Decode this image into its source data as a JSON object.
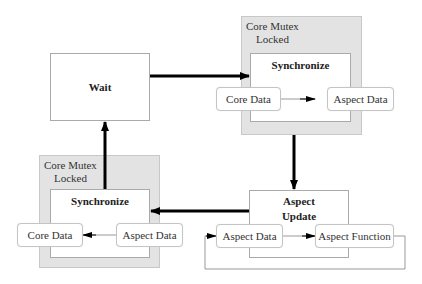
{
  "diagram": {
    "nodes": {
      "wait": {
        "label": "Wait"
      },
      "sync_top": {
        "group_label_line1": "Core Mutex",
        "group_label_line2": "Locked",
        "title": "Synchronize",
        "core_data": "Core Data",
        "aspect_data": "Aspect Data"
      },
      "aspect_update": {
        "title_line1": "Aspect",
        "title_line2": "Update",
        "aspect_data": "Aspect Data",
        "aspect_function": "Aspect Function"
      },
      "sync_bottom": {
        "group_label_line1": "Core Mutex",
        "group_label_line2": "Locked",
        "title": "Synchronize",
        "core_data": "Core Data",
        "aspect_data": "Aspect Data"
      }
    },
    "edges": [
      {
        "from": "Wait",
        "to": "Synchronize (top)"
      },
      {
        "from": "Core Data",
        "to": "Aspect Data",
        "within": "Synchronize (top)"
      },
      {
        "from": "Synchronize (top)",
        "to": "Aspect Update"
      },
      {
        "from": "Aspect Data",
        "to": "Aspect Function",
        "within": "Aspect Update"
      },
      {
        "from": "Aspect Function",
        "to": "Aspect Data",
        "type": "loop"
      },
      {
        "from": "Aspect Update",
        "to": "Synchronize (bottom)"
      },
      {
        "from": "Aspect Data",
        "to": "Core Data",
        "within": "Synchronize (bottom)"
      },
      {
        "from": "Synchronize (bottom)",
        "to": "Wait"
      }
    ],
    "colors": {
      "mutex_fill": "#e3e3e3",
      "box_border": "#aaaaaa",
      "arrow": "#000000",
      "thin_line": "#999999"
    }
  }
}
